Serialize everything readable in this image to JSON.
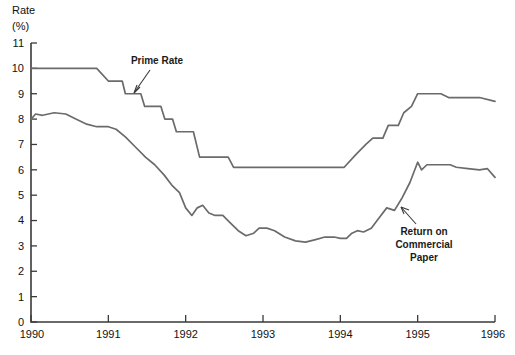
{
  "axis": {
    "y_title_line1": "Rate",
    "y_title_line2": "(%)",
    "y_ticks": [
      "0",
      "1",
      "2",
      "3",
      "4",
      "5",
      "6",
      "7",
      "8",
      "9",
      "10",
      "11"
    ],
    "x_ticks": [
      "1990",
      "1991",
      "1992",
      "1993",
      "1994",
      "1995",
      "1996"
    ]
  },
  "annotations": {
    "prime": {
      "label": "Prime Rate"
    },
    "paper": {
      "line1": "Return on",
      "line2": "Commercial",
      "line3": "Paper"
    }
  },
  "colors": {
    "line": "#6b6b6b",
    "axis": "#3a3a3a",
    "text": "#111111",
    "background": "#ffffff"
  },
  "chart_data": {
    "type": "line",
    "title": "",
    "xlabel": "",
    "ylabel": "Rate (%)",
    "xlim": [
      1990,
      1996
    ],
    "ylim": [
      0,
      11
    ],
    "grid": false,
    "legend": "annotations-inline",
    "series": [
      {
        "name": "Prime Rate",
        "color": "#6b6b6b",
        "points": [
          [
            1990.0,
            10.0
          ],
          [
            1990.85,
            10.0
          ],
          [
            1991.0,
            9.5
          ],
          [
            1991.18,
            9.5
          ],
          [
            1991.22,
            9.0
          ],
          [
            1991.42,
            9.0
          ],
          [
            1991.47,
            8.5
          ],
          [
            1991.68,
            8.5
          ],
          [
            1991.73,
            8.0
          ],
          [
            1991.83,
            8.0
          ],
          [
            1991.88,
            7.5
          ],
          [
            1992.1,
            7.5
          ],
          [
            1992.18,
            6.5
          ],
          [
            1992.55,
            6.5
          ],
          [
            1992.62,
            6.1
          ],
          [
            1994.05,
            6.1
          ],
          [
            1994.2,
            6.6
          ],
          [
            1994.33,
            7.0
          ],
          [
            1994.42,
            7.25
          ],
          [
            1994.55,
            7.25
          ],
          [
            1994.62,
            7.75
          ],
          [
            1994.75,
            7.75
          ],
          [
            1994.82,
            8.25
          ],
          [
            1994.92,
            8.5
          ],
          [
            1995.0,
            9.0
          ],
          [
            1995.3,
            9.0
          ],
          [
            1995.4,
            8.85
          ],
          [
            1995.8,
            8.85
          ],
          [
            1996.0,
            8.7
          ]
        ]
      },
      {
        "name": "Return on Commercial Paper",
        "color": "#6b6b6b",
        "points": [
          [
            1990.0,
            8.0
          ],
          [
            1990.06,
            8.2
          ],
          [
            1990.15,
            8.15
          ],
          [
            1990.3,
            8.25
          ],
          [
            1990.45,
            8.2
          ],
          [
            1990.58,
            8.0
          ],
          [
            1990.72,
            7.8
          ],
          [
            1990.85,
            7.7
          ],
          [
            1991.0,
            7.7
          ],
          [
            1991.1,
            7.6
          ],
          [
            1991.22,
            7.3
          ],
          [
            1991.35,
            6.9
          ],
          [
            1991.48,
            6.5
          ],
          [
            1991.6,
            6.2
          ],
          [
            1991.72,
            5.8
          ],
          [
            1991.82,
            5.4
          ],
          [
            1991.92,
            5.1
          ],
          [
            1992.0,
            4.5
          ],
          [
            1992.08,
            4.2
          ],
          [
            1992.15,
            4.5
          ],
          [
            1992.22,
            4.6
          ],
          [
            1992.3,
            4.3
          ],
          [
            1992.38,
            4.2
          ],
          [
            1992.48,
            4.2
          ],
          [
            1992.58,
            3.9
          ],
          [
            1992.68,
            3.6
          ],
          [
            1992.78,
            3.4
          ],
          [
            1992.88,
            3.5
          ],
          [
            1992.95,
            3.7
          ],
          [
            1993.05,
            3.7
          ],
          [
            1993.15,
            3.6
          ],
          [
            1993.28,
            3.35
          ],
          [
            1993.42,
            3.2
          ],
          [
            1993.55,
            3.15
          ],
          [
            1993.68,
            3.25
          ],
          [
            1993.8,
            3.35
          ],
          [
            1993.92,
            3.35
          ],
          [
            1994.0,
            3.3
          ],
          [
            1994.08,
            3.3
          ],
          [
            1994.15,
            3.5
          ],
          [
            1994.22,
            3.6
          ],
          [
            1994.3,
            3.55
          ],
          [
            1994.4,
            3.7
          ],
          [
            1994.5,
            4.1
          ],
          [
            1994.6,
            4.5
          ],
          [
            1994.7,
            4.4
          ],
          [
            1994.8,
            4.9
          ],
          [
            1994.9,
            5.5
          ],
          [
            1995.0,
            6.3
          ],
          [
            1995.05,
            6.0
          ],
          [
            1995.12,
            6.2
          ],
          [
            1995.25,
            6.2
          ],
          [
            1995.42,
            6.2
          ],
          [
            1995.5,
            6.1
          ],
          [
            1995.65,
            6.05
          ],
          [
            1995.8,
            6.0
          ],
          [
            1995.9,
            6.05
          ],
          [
            1996.0,
            5.7
          ]
        ]
      }
    ]
  }
}
